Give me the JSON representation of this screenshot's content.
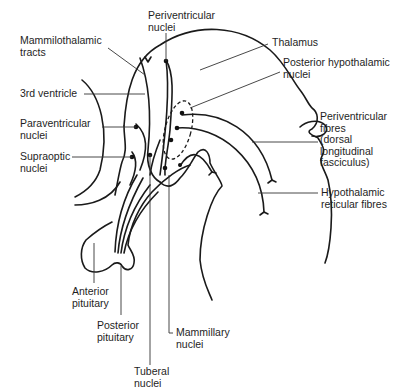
{
  "diagram": {
    "labels": {
      "periventricular_nuclei": "Periventricular\nnuclei",
      "mammilothalamic_tracts": "Mammilothalamic\ntracts",
      "thalamus": "Thalamus",
      "posterior_hypothalamic_nuclei": "Posterior hypothalamic\nnuclei",
      "third_ventricle": "3rd ventricle",
      "paraventricular_nuclei": "Paraventricular\nnuclei",
      "supraoptic_nuclei": "Supraoptic\nnuclei",
      "periventricular_fibres": "Periventricular\nfibres\n(dorsal\nlongitudinal\nfasciculus)",
      "hypothalamic_reticular_fibres": "Hypothalamic\nreticular fibres",
      "anterior_pituitary": "Anterior\npituitary",
      "posterior_pituitary": "Posterior\npituitary",
      "mammillary_nuclei": "Mammillary\nnuclei",
      "tuberal_nuclei": "Tuberal\nnuclei"
    },
    "colors": {
      "line": "#1a1a1a",
      "text": "#1e1e1e",
      "background": "#ffffff"
    }
  }
}
